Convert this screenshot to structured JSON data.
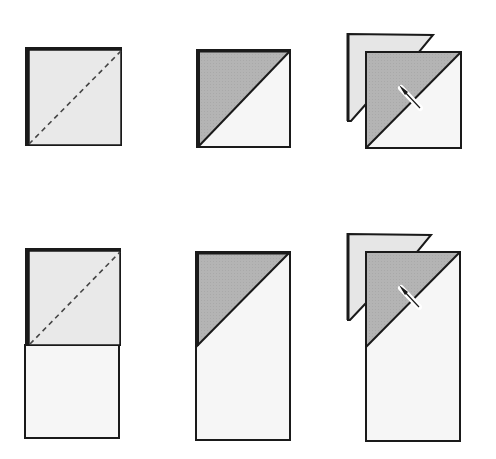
{
  "diagram": {
    "title": "",
    "colors": {
      "paper_light": "#ebebeb",
      "paper_white": "#f6f6f6",
      "folded_grey": "#b5b5b5",
      "outline": "#1a1a1a",
      "background": "#ffffff"
    },
    "rows": [
      {
        "name": "square-sequence",
        "steps": [
          {
            "label": "",
            "kind": "square-with-dashed-fold-line"
          },
          {
            "label": "",
            "kind": "square-folded-diagonally"
          },
          {
            "label": "",
            "kind": "square-cut-along-fold-with-knife"
          }
        ]
      },
      {
        "name": "rectangle-sequence",
        "steps": [
          {
            "label": "",
            "kind": "rectangle-with-dashed-fold-line"
          },
          {
            "label": "",
            "kind": "rectangle-folded-diagonally"
          },
          {
            "label": "",
            "kind": "rectangle-cut-along-fold-with-knife"
          }
        ]
      }
    ],
    "icons": [
      "knife-icon",
      "knife-icon"
    ]
  }
}
